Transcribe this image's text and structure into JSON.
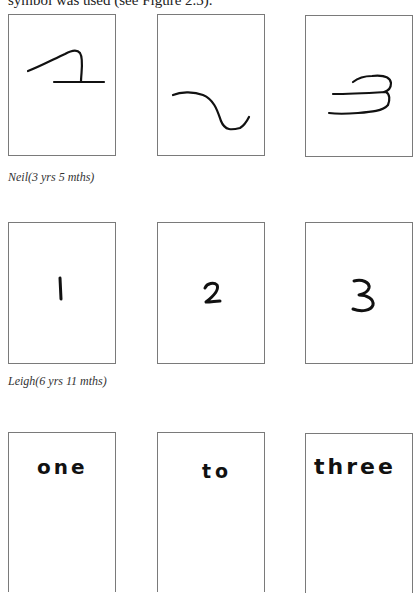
{
  "document": {
    "intro_text": "symbol was used (see Figure 2.3)."
  },
  "figure": {
    "rows": [
      {
        "child_caption": "Neil(3 yrs 5 mths)",
        "cards": [
          {
            "index": 1,
            "content_type": "scribble",
            "description": "wavy line with hook over horizontal line"
          },
          {
            "index": 2,
            "content_type": "scribble",
            "description": "s-shaped wavy line"
          },
          {
            "index": 3,
            "content_type": "scribble",
            "description": "three stacked horizontal loops resembling 3"
          }
        ]
      },
      {
        "child_caption": "Leigh(6 yrs 11 mths)",
        "cards": [
          {
            "index": 1,
            "content_type": "numeral",
            "text": "1"
          },
          {
            "index": 2,
            "content_type": "numeral",
            "text": "2"
          },
          {
            "index": 3,
            "content_type": "numeral",
            "text": "3"
          }
        ]
      },
      {
        "child_caption": "",
        "cards": [
          {
            "index": 1,
            "content_type": "word",
            "text": "one"
          },
          {
            "index": 2,
            "content_type": "word",
            "text": "to"
          },
          {
            "index": 3,
            "content_type": "word",
            "text": "three"
          }
        ]
      }
    ],
    "colors": {
      "card_border": "#7a7a7a",
      "ink": "#111111",
      "background": "#ffffff"
    }
  }
}
